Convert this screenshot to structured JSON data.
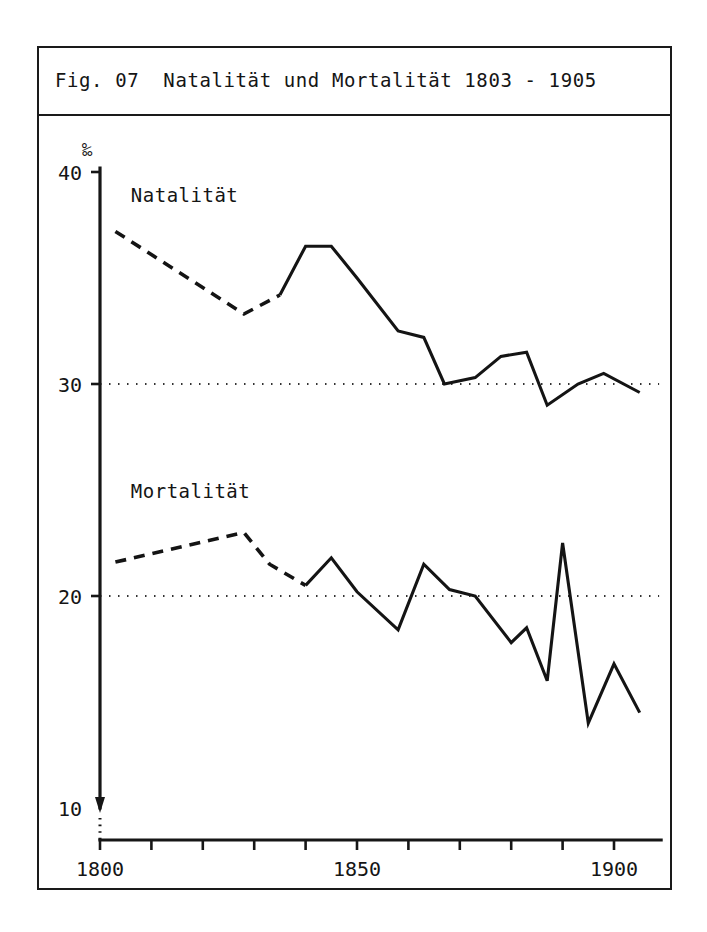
{
  "figure": {
    "title": "Fig. 07  Natalität und Mortalität 1803 - 1905",
    "unit_label": "‰",
    "natalitaet_label": "Natalität",
    "mortalitaet_label": "Mortalität",
    "frame_color": "#1a1a1a",
    "line_color": "#141414",
    "background_color": "#ffffff"
  },
  "chart_data": {
    "type": "line",
    "title": "Fig. 07  Natalität und Mortalität 1803 - 1905",
    "xlabel": "",
    "ylabel": "‰",
    "xlim": [
      1800,
      1908
    ],
    "ylim": [
      10,
      40
    ],
    "grid": true,
    "gridlines_y": [
      30,
      20
    ],
    "legend": "inline-labels",
    "x_ticks_major": [
      1800,
      1850,
      1900
    ],
    "x_tick_labels": [
      "1800",
      "1850",
      "1900"
    ],
    "x_ticks_minor": [
      1810,
      1820,
      1830,
      1840,
      1860,
      1870,
      1880,
      1890
    ],
    "y_ticks": [
      40,
      30,
      20,
      10
    ],
    "y_tick_labels": [
      "40",
      "30",
      "20",
      "10"
    ],
    "series": [
      {
        "name": "Natalität",
        "style": "solid-with-dashed-interpolation",
        "dashed_x_range": [
          1803,
          1835
        ],
        "x": [
          1803,
          1828,
          1835,
          1840,
          1845,
          1850,
          1858,
          1863,
          1867,
          1873,
          1878,
          1883,
          1887,
          1893,
          1898,
          1905
        ],
        "y": [
          37.2,
          33.3,
          34.2,
          36.5,
          36.5,
          35.0,
          32.5,
          32.2,
          30.0,
          30.3,
          31.3,
          31.5,
          29.0,
          30.0,
          30.5,
          29.6
        ]
      },
      {
        "name": "Mortalität",
        "style": "solid-with-dashed-interpolation",
        "dashed_x_range": [
          1803,
          1835
        ],
        "x": [
          1803,
          1828,
          1833,
          1840,
          1845,
          1850,
          1858,
          1863,
          1868,
          1873,
          1880,
          1883,
          1887,
          1890,
          1895,
          1900,
          1905
        ],
        "y": [
          21.6,
          23.0,
          21.5,
          20.5,
          21.8,
          20.2,
          18.4,
          21.5,
          20.3,
          20.0,
          17.8,
          18.5,
          16.0,
          22.5,
          14.0,
          16.8,
          14.5
        ]
      }
    ]
  }
}
